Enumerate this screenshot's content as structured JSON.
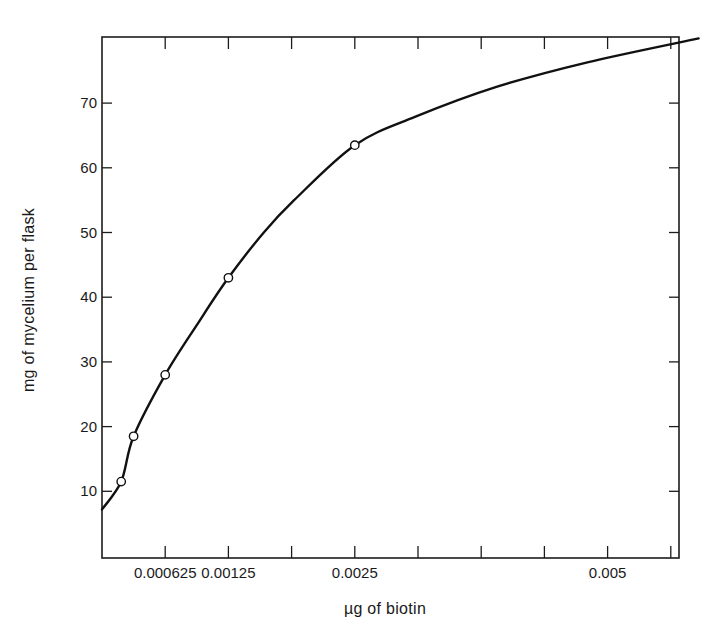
{
  "chart_data": {
    "type": "line",
    "title": "",
    "xlabel": "µg of biotin",
    "ylabel": "mg of mycelium per flask",
    "xlim": [
      0,
      0.0091
    ],
    "ylim": [
      0,
      80
    ],
    "grid": false,
    "legend": null,
    "x_ticks": [
      0.000625,
      0.00125,
      0.001875,
      0.0025,
      0.003125,
      0.00375,
      0.004375,
      0.005,
      0.005625
    ],
    "x_tick_labels": [
      {
        "value": 0.000625,
        "label": "0.000625"
      },
      {
        "value": 0.00125,
        "label": "0.00125"
      },
      {
        "value": 0.0025,
        "label": "0.0025"
      },
      {
        "value": 0.005,
        "label": "0.005"
      }
    ],
    "y_ticks": [
      10,
      20,
      30,
      40,
      50,
      60,
      70
    ],
    "y_tick_labels": [
      "10",
      "20",
      "30",
      "40",
      "50",
      "60",
      "70"
    ],
    "series": [
      {
        "name": "observed",
        "kind": "scatter",
        "marker": "open-circle",
        "points": [
          {
            "x": 0.00019,
            "y": 11.5
          },
          {
            "x": 0.0003125,
            "y": 18.5
          },
          {
            "x": 0.000625,
            "y": 28
          },
          {
            "x": 0.00125,
            "y": 43
          },
          {
            "x": 0.0025,
            "y": 63.5
          }
        ]
      },
      {
        "name": "fitted curve",
        "kind": "line",
        "points": [
          {
            "x": 0.0,
            "y": 7.2
          },
          {
            "x": 0.00019,
            "y": 11.5
          },
          {
            "x": 0.0003125,
            "y": 18.5
          },
          {
            "x": 0.000625,
            "y": 28
          },
          {
            "x": 0.00095,
            "y": 36
          },
          {
            "x": 0.00125,
            "y": 43
          },
          {
            "x": 0.0016,
            "y": 50
          },
          {
            "x": 0.0019,
            "y": 55
          },
          {
            "x": 0.0025,
            "y": 63.5
          },
          {
            "x": 0.0031,
            "y": 67.9
          },
          {
            "x": 0.0039,
            "y": 72.5
          },
          {
            "x": 0.0048,
            "y": 76.3
          },
          {
            "x": 0.0059,
            "y": 80
          }
        ]
      }
    ]
  },
  "axes": {
    "x_label": "µg of biotin",
    "y_label": "mg of mycelium per flask"
  }
}
